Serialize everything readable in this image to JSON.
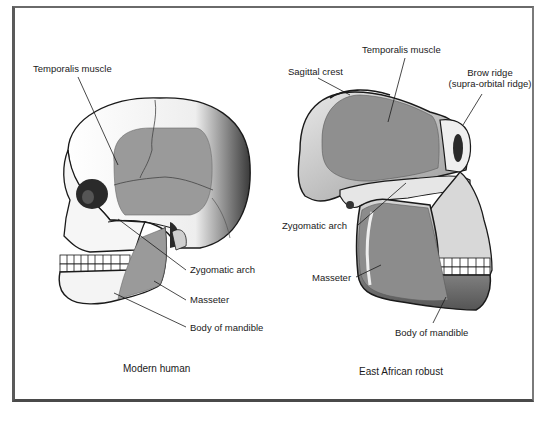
{
  "figure": {
    "left_panel": {
      "caption": "Modern human",
      "labels": {
        "temporalis": "Temporalis muscle",
        "zygomatic": "Zygomatic arch",
        "masseter": "Masseter",
        "mandible": "Body of mandible"
      }
    },
    "right_panel": {
      "caption": "East African robust",
      "labels": {
        "temporalis": "Temporalis muscle",
        "sagittal": "Sagittal crest",
        "brow_line1": "Brow ridge",
        "brow_line2": "(supra-orbital ridge)",
        "zygomatic": "Zygomatic arch",
        "masseter": "Masseter",
        "mandible": "Body of mandible"
      }
    },
    "colors": {
      "muscle_fill": "#9a9a9a",
      "bone_fill": "#f2f2f2",
      "outline": "#1a1a1a",
      "frame": "#555555"
    }
  }
}
